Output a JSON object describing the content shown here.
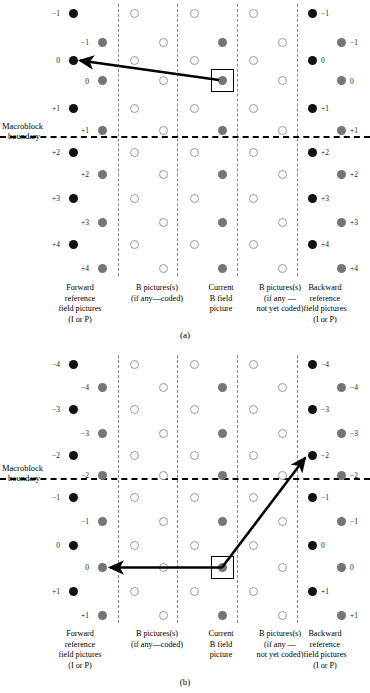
{
  "figures": [
    {
      "id": "a",
      "caption": "(a)",
      "macroblock_label_line1": "Macroblock",
      "macroblock_label_line2": "boundary",
      "columns": [
        {
          "name": "forward-reference",
          "lines": [
            "Forward",
            "reference",
            "field pictures",
            "(I or P)"
          ]
        },
        {
          "name": "b-pictures-coded",
          "lines": [
            "B pictures(s)",
            "(if any—coded)"
          ]
        },
        {
          "name": "current-b-field",
          "lines": [
            "Current",
            "B field",
            "picture"
          ]
        },
        {
          "name": "b-pictures-not-coded",
          "lines": [
            "B pictures(s)",
            "(if any —",
            "not yet coded)"
          ]
        },
        {
          "name": "backward-reference",
          "lines": [
            "Backward",
            "reference",
            "field pictures",
            "(I or P)"
          ]
        }
      ],
      "row_labels_left": [
        "−1",
        "−1",
        "0",
        "0",
        "+1",
        "+1",
        "+2",
        "+2",
        "+3",
        "+3",
        "+4",
        "+4"
      ],
      "row_labels_right": [
        "−1",
        "−1",
        "0",
        "0",
        "+1",
        "+1",
        "+2",
        "+2",
        "+3",
        "+3",
        "+4",
        "+4"
      ],
      "boundary_after_row": 6,
      "motion_vectors": [
        {
          "name": "backward-to-forward-vector",
          "from": "current-b-field-row-3",
          "to": "forward-reference-row-2"
        }
      ]
    },
    {
      "id": "b",
      "caption": "(b)",
      "macroblock_label_line1": "Macroblock",
      "macroblock_label_line2": "boundary",
      "columns": [
        {
          "name": "forward-reference",
          "lines": [
            "Forward",
            "reference",
            "field pictures",
            "(I or P)"
          ]
        },
        {
          "name": "b-pictures-coded",
          "lines": [
            "B pictures(s)",
            "(if any—coded)"
          ]
        },
        {
          "name": "current-b-field",
          "lines": [
            "Current",
            "B field",
            "picture"
          ]
        },
        {
          "name": "b-pictures-not-coded",
          "lines": [
            "B pictures(s)",
            "(if any —",
            "not yet coded)"
          ]
        },
        {
          "name": "backward-reference",
          "lines": [
            "Backward",
            "reference",
            "field pictures",
            "(I or P)"
          ]
        }
      ],
      "row_labels_left": [
        "−4",
        "−4",
        "−3",
        "−3",
        "−2",
        "−2",
        "−1",
        "−1",
        "0",
        "0",
        "+1",
        "+1"
      ],
      "row_labels_right": [
        "−4",
        "−4",
        "−3",
        "−3",
        "−2",
        "−2",
        "−1",
        "−1",
        "0",
        "0",
        "+1",
        "+1"
      ],
      "boundary_after_row": 6,
      "motion_vectors": [
        {
          "name": "forward-vector",
          "from": "current-b-field-row-9",
          "to": "forward-reference-row-9"
        },
        {
          "name": "backward-vector",
          "from": "current-b-field-row-9",
          "to": "backward-reference-row-4"
        }
      ]
    }
  ],
  "colors": {
    "black_dot": "#111111",
    "gray_dot": "#757575",
    "open_dot_border": "#9a9a9a",
    "separator": "#888888",
    "boundary": "#000000"
  }
}
